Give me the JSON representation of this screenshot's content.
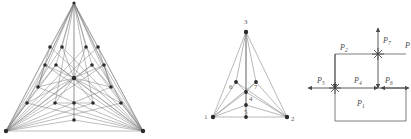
{
  "page": {
    "background": "#ffffff",
    "width": 411,
    "height": 139,
    "figure_count": 3
  },
  "colors": {
    "edge": "#6e6e6e",
    "edge_light": "#9a9a9a",
    "node": "#2b2b2b",
    "label": "#5a5a5a",
    "arrow": "#4a4a4a"
  },
  "figures": {
    "left": {
      "name": "dense-triangular-graph",
      "caption": "",
      "node_count": 22,
      "labels": []
    },
    "middle": {
      "name": "labeled-triangular-graph",
      "caption": "",
      "labels": [
        {
          "id": "v3",
          "text": "3",
          "x": 97,
          "y": 22
        },
        {
          "id": "v6",
          "text": "6",
          "x": 84,
          "y": 88
        },
        {
          "id": "v7",
          "text": "7",
          "x": 105,
          "y": 88
        },
        {
          "id": "v4",
          "text": "4",
          "x": 99,
          "y": 99
        },
        {
          "id": "v5",
          "text": "5",
          "x": 95,
          "y": 113
        },
        {
          "id": "v1",
          "text": "1",
          "x": 56,
          "y": 114
        },
        {
          "id": "v2",
          "text": "2",
          "x": 142,
          "y": 117
        }
      ]
    },
    "right": {
      "name": "force-vector-diagram",
      "caption": "",
      "labels": [
        {
          "id": "P1",
          "base": "P",
          "sub": "1",
          "x": 55,
          "y": 101
        },
        {
          "id": "P2",
          "base": "P",
          "sub": "2",
          "x": 33,
          "y": 49
        },
        {
          "id": "P4",
          "base": "P",
          "sub": "4",
          "x": 53,
          "y": 80
        },
        {
          "id": "P5",
          "base": "P",
          "sub": "5",
          "x": 21,
          "y": 80
        },
        {
          "id": "P6",
          "base": "P",
          "sub": "6",
          "x": 78,
          "y": 80
        },
        {
          "id": "P7",
          "base": "P",
          "sub": "7",
          "x": 76,
          "y": 45
        },
        {
          "id": "P3",
          "base": "P",
          "sub": "",
          "x": 98,
          "y": 50
        }
      ]
    }
  }
}
